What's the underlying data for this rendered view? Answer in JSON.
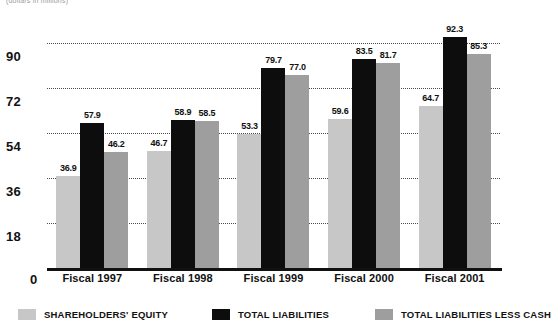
{
  "caption": {
    "clipped_text": "(dollars in millions)"
  },
  "chart_data": {
    "type": "bar",
    "title": "",
    "subtitle": "",
    "xlabel": "",
    "ylabel": "",
    "ylim": [
      0,
      99
    ],
    "yticks": [
      0,
      18,
      36,
      54,
      72,
      90
    ],
    "ytick_labels": [
      "0",
      "18",
      "36",
      "54",
      "72",
      "90"
    ],
    "grid": true,
    "grid_style": "dotted-horizontal",
    "legend_position": "bottom",
    "categories": [
      "Fiscal 1997",
      "Fiscal 1998",
      "Fiscal 1999",
      "Fiscal 2000",
      "Fiscal 2001"
    ],
    "series": [
      {
        "name": "SHAREHOLDERS' EQUITY",
        "color": "#c7c7c7",
        "values": [
          36.9,
          46.7,
          53.3,
          59.6,
          64.7
        ],
        "labels": [
          "36.9",
          "46.7",
          "53.3",
          "59.6",
          "64.7"
        ]
      },
      {
        "name": "TOTAL LIABILITIES",
        "color": "#0d0d0d",
        "values": [
          57.9,
          58.9,
          79.7,
          83.5,
          92.3
        ],
        "labels": [
          "57.9",
          "58.9",
          "79.7",
          "83.5",
          "92.3"
        ]
      },
      {
        "name": "TOTAL LIABILITIES LESS CASH",
        "color": "#9e9e9e",
        "values": [
          46.2,
          58.5,
          77.0,
          81.7,
          85.3
        ],
        "labels": [
          "46.2",
          "58.5",
          "77.0",
          "81.7",
          "85.3"
        ]
      }
    ]
  }
}
